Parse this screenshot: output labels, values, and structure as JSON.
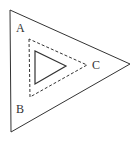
{
  "diagram": {
    "labels": {
      "a": "A",
      "b": "B",
      "c": "C"
    },
    "stroke_color": "#333333",
    "background": "#ffffff",
    "shapes": [
      {
        "name": "outer-triangle",
        "style": "solid"
      },
      {
        "name": "middle-triangle",
        "style": "dashed"
      },
      {
        "name": "inner-triangle",
        "style": "solid"
      }
    ]
  }
}
